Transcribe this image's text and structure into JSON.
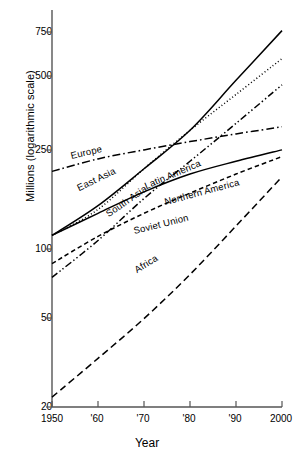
{
  "chart_data": {
    "type": "line",
    "title": "",
    "xlabel": "Year",
    "ylabel": "Millions (logarithmic scale)",
    "scale": "log",
    "grid": false,
    "legend_position": "inline-labels",
    "xlim": [
      1950,
      2000
    ],
    "ylim": [
      20,
      850
    ],
    "x": [
      1950,
      1960,
      1970,
      1980,
      1990,
      2000
    ],
    "xticklabels": [
      "1950",
      "'60",
      "'70",
      "'80",
      "'90",
      "2000"
    ],
    "yticks": [
      20,
      50,
      100,
      250,
      500,
      750
    ],
    "yticklabels": [
      "20",
      "50",
      "100",
      "250",
      "500",
      "750"
    ],
    "series": [
      {
        "name": "Europe",
        "label": "Europe",
        "style": "dashdot",
        "values": [
          195,
          220,
          240,
          260,
          280,
          300
        ]
      },
      {
        "name": "East Asia",
        "label": "East Asia",
        "style": "dotted",
        "values": [
          105,
          135,
          200,
          290,
          410,
          580
        ]
      },
      {
        "name": "South Asia",
        "label": "South Asia",
        "style": "solid",
        "values": [
          105,
          140,
          200,
          290,
          470,
          760
        ]
      },
      {
        "name": "Latin America",
        "label": "Latin America",
        "style": "dashdotdot",
        "values": [
          70,
          100,
          150,
          215,
          310,
          450
        ]
      },
      {
        "name": "Northern America",
        "label": "Northern America",
        "style": "solid",
        "values": [
          105,
          130,
          160,
          190,
          215,
          240
        ]
      },
      {
        "name": "Soviet Union",
        "label": "Soviet Union",
        "style": "dashed",
        "values": [
          80,
          104,
          130,
          158,
          190,
          225
        ]
      },
      {
        "name": "Africa",
        "label": "Africa",
        "style": "longdash",
        "values": [
          22,
          32,
          47,
          72,
          115,
          185
        ]
      }
    ],
    "axis_color": "#444444",
    "line_color": "#000000"
  },
  "axes": {
    "y_title": "Millions (logarithmic scale)",
    "x_title": "Year"
  },
  "series_labels": {
    "europe": "Europe",
    "east_asia": "East Asia",
    "south_asia": "South Asia",
    "latin_america": "Latin America",
    "northern_america": "Northern America",
    "soviet_union": "Soviet Union",
    "africa": "Africa"
  },
  "yticks": {
    "t750": "750",
    "t500": "500",
    "t250": "250",
    "t100": "100",
    "t50": "50",
    "t20": "20"
  },
  "xticks": {
    "t1950": "1950",
    "t1960": "'60",
    "t1970": "'70",
    "t1980": "'80",
    "t1990": "'90",
    "t2000": "2000"
  }
}
